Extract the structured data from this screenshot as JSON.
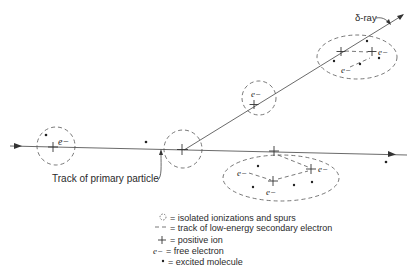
{
  "diagram": {
    "labels": {
      "primary_track": "Track of primary particle",
      "delta_ray": "δ-ray",
      "electron": "e−"
    },
    "legend": [
      {
        "symbol": "dashed-circle",
        "text": "= isolated ionizations and spurs"
      },
      {
        "symbol": "dashed-line",
        "text": "= track of low-energy secondary electron"
      },
      {
        "symbol": "+",
        "text": "= positive ion"
      },
      {
        "symbol": "e−",
        "text": "= free electron"
      },
      {
        "symbol": "*",
        "text": "= excited molecule"
      }
    ],
    "colors": {
      "ink": "#333333",
      "background": "#ffffff"
    }
  }
}
